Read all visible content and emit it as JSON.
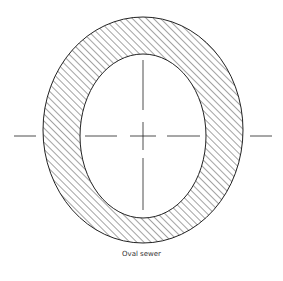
{
  "caption": "Oval sewer",
  "colors": {
    "stroke": "#222222",
    "background": "#ffffff"
  }
}
